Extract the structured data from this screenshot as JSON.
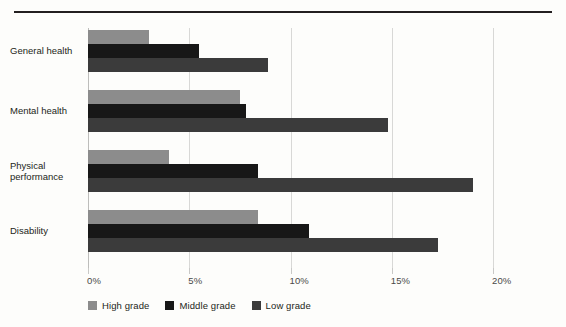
{
  "chart_data": {
    "type": "bar",
    "orientation": "horizontal",
    "title": "",
    "xlabel": "",
    "ylabel": "",
    "xlim": [
      0,
      20
    ],
    "xticks": [
      0,
      5,
      10,
      15,
      20
    ],
    "xtick_labels": [
      "0%",
      "5%",
      "10%",
      "15%",
      "20%"
    ],
    "grid": true,
    "legend_position": "bottom",
    "categories": [
      "General health",
      "Mental health",
      "Physical performance",
      "Disability"
    ],
    "category_label_lines": [
      [
        "General health"
      ],
      [
        "Mental health"
      ],
      [
        "Physical",
        "performance"
      ],
      [
        "Disability"
      ]
    ],
    "series": [
      {
        "name": "High grade",
        "color": "#8c8c8c",
        "values": [
          3.0,
          7.5,
          4.0,
          8.4
        ]
      },
      {
        "name": "Middle grade",
        "color": "#171717",
        "values": [
          5.5,
          7.8,
          8.4,
          10.9
        ]
      },
      {
        "name": "Low grade",
        "color": "#3b3b3b",
        "values": [
          8.9,
          14.8,
          19.0,
          17.3
        ]
      }
    ]
  },
  "colors": {
    "background": "#fdfdfb",
    "rule": "#231f20",
    "gridline": "#d8d8d6",
    "axis": "#bdbdbb",
    "text": "#231f20",
    "tick_text": "#4a4a48",
    "high_grade": "#8c8c8c",
    "middle_grade": "#171717",
    "low_grade": "#3b3b3b"
  }
}
